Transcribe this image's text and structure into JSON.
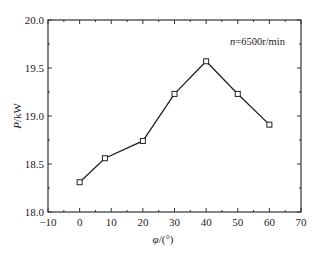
{
  "chart_data": {
    "type": "line",
    "title": "",
    "xlabel": "φ/(°)",
    "ylabel": "P/kW",
    "xlim": [
      -10,
      70
    ],
    "ylim": [
      18.0,
      20.0
    ],
    "x_ticks": [
      -10,
      0,
      10,
      20,
      30,
      40,
      50,
      60,
      70
    ],
    "x_tick_labels": [
      "−10",
      "0",
      "10",
      "20",
      "30",
      "40",
      "50",
      "60",
      "70"
    ],
    "y_ticks": [
      18.0,
      18.5,
      19.0,
      19.5,
      20.0
    ],
    "y_tick_labels": [
      "18.0",
      "18.5",
      "19.0",
      "19.5",
      "20.0"
    ],
    "grid": false,
    "annotation": "n=6500r/min",
    "series": [
      {
        "name": "n=6500r/min",
        "marker": "open-square",
        "color": "#222222",
        "x": [
          0,
          8,
          20,
          30,
          40,
          50,
          60
        ],
        "y": [
          18.31,
          18.56,
          18.74,
          19.23,
          19.57,
          19.23,
          18.91
        ]
      }
    ]
  },
  "labels": {
    "xlabel_italic": "φ",
    "xlabel_rest": "/(°)",
    "ylabel_italic": "P",
    "ylabel_rest": "/kW",
    "annot_italic": "n",
    "annot_rest": "=6500r/min"
  }
}
